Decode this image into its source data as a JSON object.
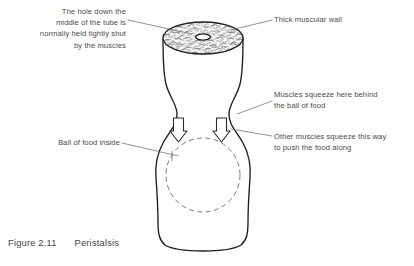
{
  "figure": {
    "number": "Figure 2.11",
    "title": "Peristalsis"
  },
  "diagram": {
    "colors": {
      "stroke": "#1d1d1d",
      "text": "#4a4a4a",
      "leader": "#6f6f6f",
      "dashed": "#7a7a7a",
      "stipple": "#2b2b2b",
      "background": "#ffffff"
    },
    "parts": {
      "tube": "muscular-tube",
      "lumen": "central-hole",
      "bolus": "ball-of-food",
      "arrows": 2
    }
  },
  "labels": {
    "hole": "The hole down the\nmiddle of the tube is\nnormally held tightly shut\nby the muscles",
    "wall": "Thick muscular wall",
    "squeeze_behind": "Muscles squeeze here behind\nthe ball of food",
    "ball": "Ball of food inside",
    "squeeze_push": "Other muscles squeeze this way\nto push the food along"
  }
}
